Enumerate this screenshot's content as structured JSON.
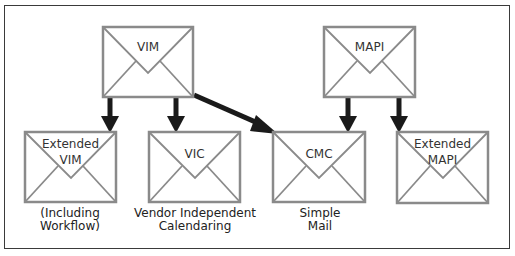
{
  "diagram": {
    "nodes": [
      {
        "id": "vim",
        "label": "VIM",
        "x": 102,
        "y": 26,
        "w": 92,
        "h": 72
      },
      {
        "id": "mapi",
        "label": "MAPI",
        "x": 323,
        "y": 26,
        "w": 93,
        "h": 72
      },
      {
        "id": "ext_vim",
        "label_line1": "Extended",
        "label_line2": "VIM",
        "caption_line1": "(Including",
        "caption_line2": "Workflow)",
        "x": 24,
        "y": 131,
        "w": 93,
        "h": 72
      },
      {
        "id": "vic",
        "label": "VIC",
        "caption_line1": "Vendor Independent",
        "caption_line2": "Calendaring",
        "x": 148,
        "y": 131,
        "w": 93,
        "h": 72
      },
      {
        "id": "cmc",
        "label": "CMC",
        "caption_line1": "Simple",
        "caption_line2": "Mail",
        "x": 272,
        "y": 131,
        "w": 94,
        "h": 72
      },
      {
        "id": "ext_mapi",
        "label_line1": "Extended",
        "label_line2": "MAPI",
        "x": 396,
        "y": 131,
        "w": 93,
        "h": 72
      }
    ],
    "edges": [
      {
        "from": "vim",
        "to": "ext_vim"
      },
      {
        "from": "vim",
        "to": "vic"
      },
      {
        "from": "vim",
        "to": "cmc"
      },
      {
        "from": "mapi",
        "to": "cmc"
      },
      {
        "from": "mapi",
        "to": "ext_mapi"
      }
    ],
    "colors": {
      "envelope_border": "#8a8a8a",
      "envelope_fill": "#ffffff",
      "arrow": "#1a1a1a",
      "frame": "#3a3a3a"
    }
  }
}
